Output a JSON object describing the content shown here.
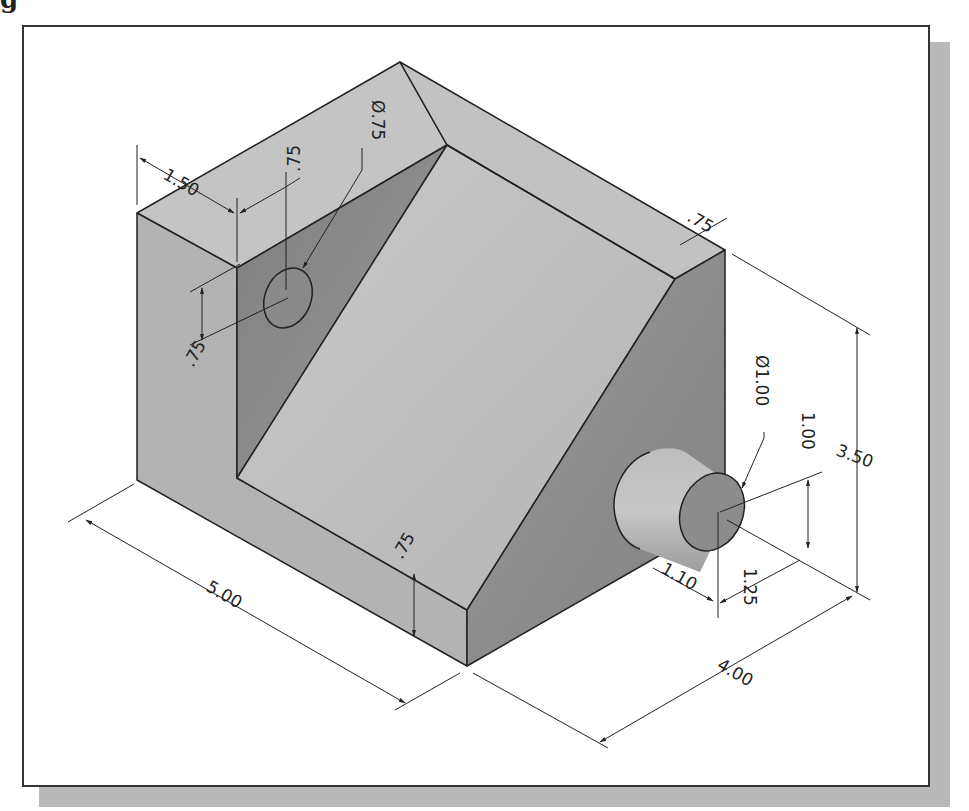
{
  "figure": {
    "caption_fragment": "g",
    "colors": {
      "frame_border": "#333333",
      "frame_shadow": "#b9b9b9",
      "top_face": "#c4c4c4",
      "front_face": "#b3b3b3",
      "right_face": "#8e8e8e",
      "slot_face": "#8a8a8a",
      "slope_face": "#bdbdbd",
      "boss_side": "#b0b0b0",
      "boss_end": "#8c8c8c",
      "edge": "#222222"
    }
  },
  "dimensions": {
    "left_slot_width": "1.50",
    "hole_offset_top": ".75",
    "hole_diameter": "Ø.75",
    "hole_offset_side": ".75",
    "ledge_width": ".75",
    "overall_length": "5.00",
    "base_thickness": ".75",
    "overall_width": "4.00",
    "overall_height": "3.50",
    "boss_diameter": "Ø1.00",
    "boss_height_from_base": "1.00",
    "boss_offset": "1.25",
    "boss_length": "1.10"
  }
}
